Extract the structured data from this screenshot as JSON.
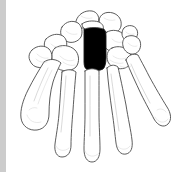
{
  "figure": {
    "technique": "black and white line drawing with one bone filled solid black",
    "width_px": 183,
    "height_px": 180,
    "background_color": "#ffffff",
    "outline_color": "#4a4a4a",
    "shading_color": "#c4c4c4",
    "highlight_fill_color": "#000000",
    "gutter_color": "#cccccc"
  },
  "gutter": {
    "name": "left-edge-band",
    "color": "#cccccc",
    "width_px": 6,
    "height_px": 172
  },
  "highlighted_bone": {
    "label": "capitate",
    "fill": "#000000",
    "region": "central carpal row"
  },
  "anatomy": {
    "carpal_bones": [
      "scaphoid",
      "lunate",
      "triquetrum",
      "pisiform",
      "trapezium",
      "trapezoid",
      "capitate",
      "hamate"
    ],
    "metacarpals": [
      "first metacarpal (thumb)",
      "second metacarpal",
      "third metacarpal",
      "fourth metacarpal",
      "fifth metacarpal"
    ]
  },
  "text": {
    "alt": "Line drawing of the bones of a hand viewed from the palm, with the capitate bone shaded solid black.",
    "caption": ""
  }
}
